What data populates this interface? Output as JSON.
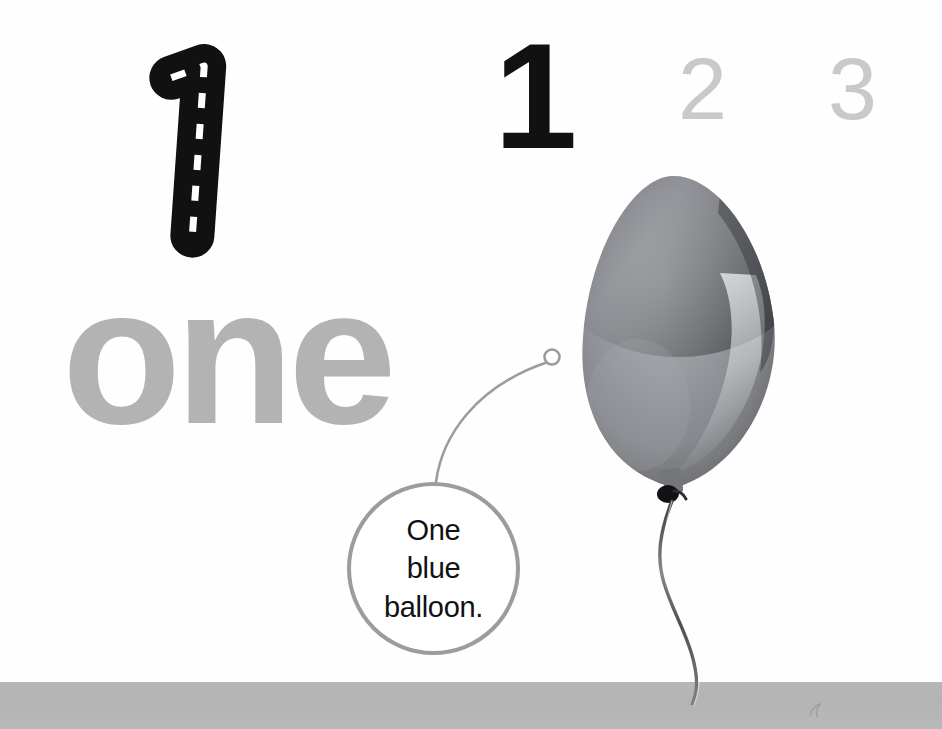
{
  "page": {
    "background_color": "#fefefe",
    "floor_band_color": "#b5b5b5",
    "width": 942,
    "height": 729
  },
  "trace": {
    "numeral": "1",
    "style": "dashed-guide",
    "stroke_color": "#111111",
    "dash_color": "#ffffff"
  },
  "numerals": {
    "current": {
      "label": "1",
      "color": "#111111",
      "state": "active"
    },
    "upcoming": [
      {
        "label": "2",
        "color": "#c9c9c9",
        "state": "inactive"
      },
      {
        "label": "3",
        "color": "#c9c9c9",
        "state": "inactive"
      }
    ]
  },
  "word": {
    "label": "one",
    "color": "#b3b3b3"
  },
  "illustration": {
    "subject": "balloon",
    "body_color": "#8f9196",
    "highlight_color": "#c9cbcf",
    "shadow_color": "#5d5f63",
    "knot_color": "#141414",
    "string_color": "#6f7175",
    "connector_dot": "leader-endpoint-circle"
  },
  "caption": {
    "lines": [
      "One",
      "blue",
      "balloon."
    ],
    "text": "One\nblue\nballoon.",
    "border_color": "#9c9c9c",
    "text_color": "#111111"
  },
  "leader": {
    "line_color": "#9c9c9c",
    "endpoint_shape": "circle"
  }
}
